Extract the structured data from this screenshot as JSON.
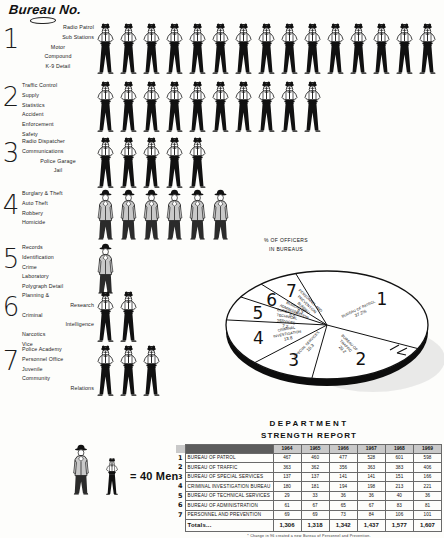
{
  "header": {
    "title": "Bureau No."
  },
  "men_per_figure": 40,
  "legend": {
    "text": "= 40 Men"
  },
  "bureaus": [
    {
      "number": "1",
      "labels": [
        "Radio Patrol",
        "Sub  Stations",
        "Motor",
        "Compound",
        "K-9 Detail"
      ],
      "label_align": [
        "right",
        "right",
        "center",
        "center",
        "center"
      ],
      "figure_count": 15,
      "figure_type": "officer"
    },
    {
      "number": "2",
      "labels": [
        "Traffic Control",
        "Supply",
        "Statistics",
        "Accident",
        "Enforcement",
        "Safety"
      ],
      "label_align": [
        "left",
        "left",
        "left",
        "left",
        "left",
        "left"
      ],
      "figure_count": 10,
      "figure_type": "officer"
    },
    {
      "number": "3",
      "labels": [
        "Radio Dispatcher",
        "Communications",
        "Police  Garage",
        "Jail"
      ],
      "label_align": [
        "left",
        "left",
        "center",
        "center"
      ],
      "figure_count": 5,
      "figure_type": "officer"
    },
    {
      "number": "4",
      "labels": [
        "Burglary & Theft",
        "Auto Theft",
        "Robbery",
        "Homicide"
      ],
      "label_align": [
        "left",
        "left",
        "left",
        "left"
      ],
      "figure_count": 6,
      "figure_type": "detective"
    },
    {
      "number": "5",
      "labels": [
        "Records",
        "Identification",
        "Crime",
        "Laboratory",
        "Polygraph Detail"
      ],
      "label_align": [
        "left",
        "left",
        "left",
        "left",
        "left"
      ],
      "figure_count": 1,
      "figure_type": "detective"
    },
    {
      "number": "6",
      "labels": [
        "Planning &",
        "Research",
        "Criminal",
        "Intelligence",
        "Narcotics",
        "Vice"
      ],
      "label_align": [
        "left",
        "right",
        "left",
        "right",
        "left",
        "left"
      ],
      "figure_count": 2,
      "figure_type": "officer"
    },
    {
      "number": "7",
      "labels": [
        "Police  Academy",
        "Personnel  Office",
        "Juvenile",
        "Community",
        "Relations"
      ],
      "label_align": [
        "left",
        "left",
        "left",
        "left",
        "right"
      ],
      "figure_count": 3,
      "figure_type": "officer"
    }
  ],
  "chart_data": {
    "type": "pie",
    "title": "% OF OFFICERS IN BUREAUS",
    "title_lines": [
      "% OF OFFICERS",
      "IN BUREAUS"
    ],
    "categories": [
      "BUREAU OF PATROL",
      "BUREAU OF TRAFFIC",
      "SPECIAL SERVICES",
      "CRIMINAL INVESTIGATION",
      "BUREAU OF TECHNICAL SERVICES",
      "BUREAU OF ADMINISTRATION",
      "PERSONNEL AND PREVENTION BUREAU"
    ],
    "values": [
      37.2,
      20.2,
      10.3,
      13.8,
      7.2,
      5.0,
      6.3
    ],
    "slice_numbers": [
      "1",
      "2",
      "3",
      "4",
      "5",
      "6",
      "7"
    ],
    "value_labels": [
      "37.2%",
      "20.2",
      "10.3",
      "13.8",
      "7.2",
      "5.0",
      "6.3"
    ],
    "legend_position": "in-slice",
    "grid": false
  },
  "table": {
    "title_line1": "DEPARTMENT",
    "title_line2": "STRENGTH REPORT",
    "corner_header": "",
    "year_headers": [
      "1964",
      "1965",
      "1966",
      "1967",
      "1968",
      "1969"
    ],
    "rows": [
      {
        "num": "1",
        "bureau": "BUREAU OF PATROL",
        "values": [
          "467",
          "460",
          "477",
          "528",
          "601",
          "598"
        ]
      },
      {
        "num": "2",
        "bureau": "BUREAU OF TRAFFIC",
        "values": [
          "363",
          "362",
          "356",
          "363",
          "383",
          "406"
        ]
      },
      {
        "num": "3",
        "bureau": "BUREAU OF SPECIAL SERVICES",
        "values": [
          "137",
          "137",
          "141",
          "141",
          "151",
          "166"
        ]
      },
      {
        "num": "4",
        "bureau": "CRIMINAL INVESTIGATION BUREAU",
        "values": [
          "180",
          "181",
          "194",
          "198",
          "213",
          "221"
        ]
      },
      {
        "num": "5",
        "bureau": "BUREAU OF TECHNICAL SERVICES",
        "values": [
          "29",
          "33",
          "36",
          "36",
          "40",
          "36"
        ]
      },
      {
        "num": "6",
        "bureau": "BUREAU OF ADMINISTRATION",
        "values": [
          "61",
          "67",
          "65",
          "67",
          "83",
          "81"
        ]
      },
      {
        "num": "7",
        "bureau": "PERSONNEL AND PREVENTION",
        "values": [
          "69",
          "69",
          "73",
          "84",
          "106",
          "101"
        ]
      }
    ],
    "totals_label": "Totals...",
    "totals": [
      "1,306",
      "1,318",
      "1,342",
      "1,437",
      "1,577",
      "1,607"
    ],
    "footnote": "* Change in 96 created a new Bureau of Personnel and Prevention."
  }
}
